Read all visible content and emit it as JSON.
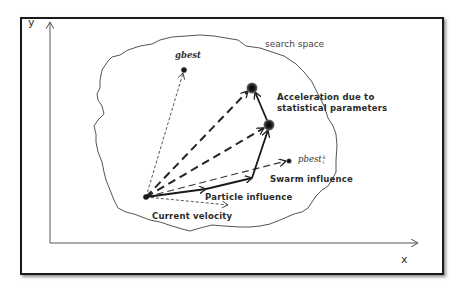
{
  "diagram": {
    "title": "",
    "axes": {
      "x_label": "x",
      "y_label": "y"
    },
    "region_label": "search space",
    "points": {
      "gbest": {
        "label": "gbest"
      },
      "pbest": {
        "label": "pbest",
        "superscript": "k",
        "subscript": "i"
      }
    },
    "annotations": {
      "acceleration_line1": "Acceleration due to",
      "acceleration_line2": "statistical parameters",
      "swarm_influence": "Swarm influence",
      "particle_influence": "Particle influence",
      "current_velocity": "Current velocity"
    },
    "colors": {
      "frame": "#1a1a1a",
      "line": "#222222",
      "boundary": "#555555",
      "node": "#1c1c1c"
    }
  }
}
